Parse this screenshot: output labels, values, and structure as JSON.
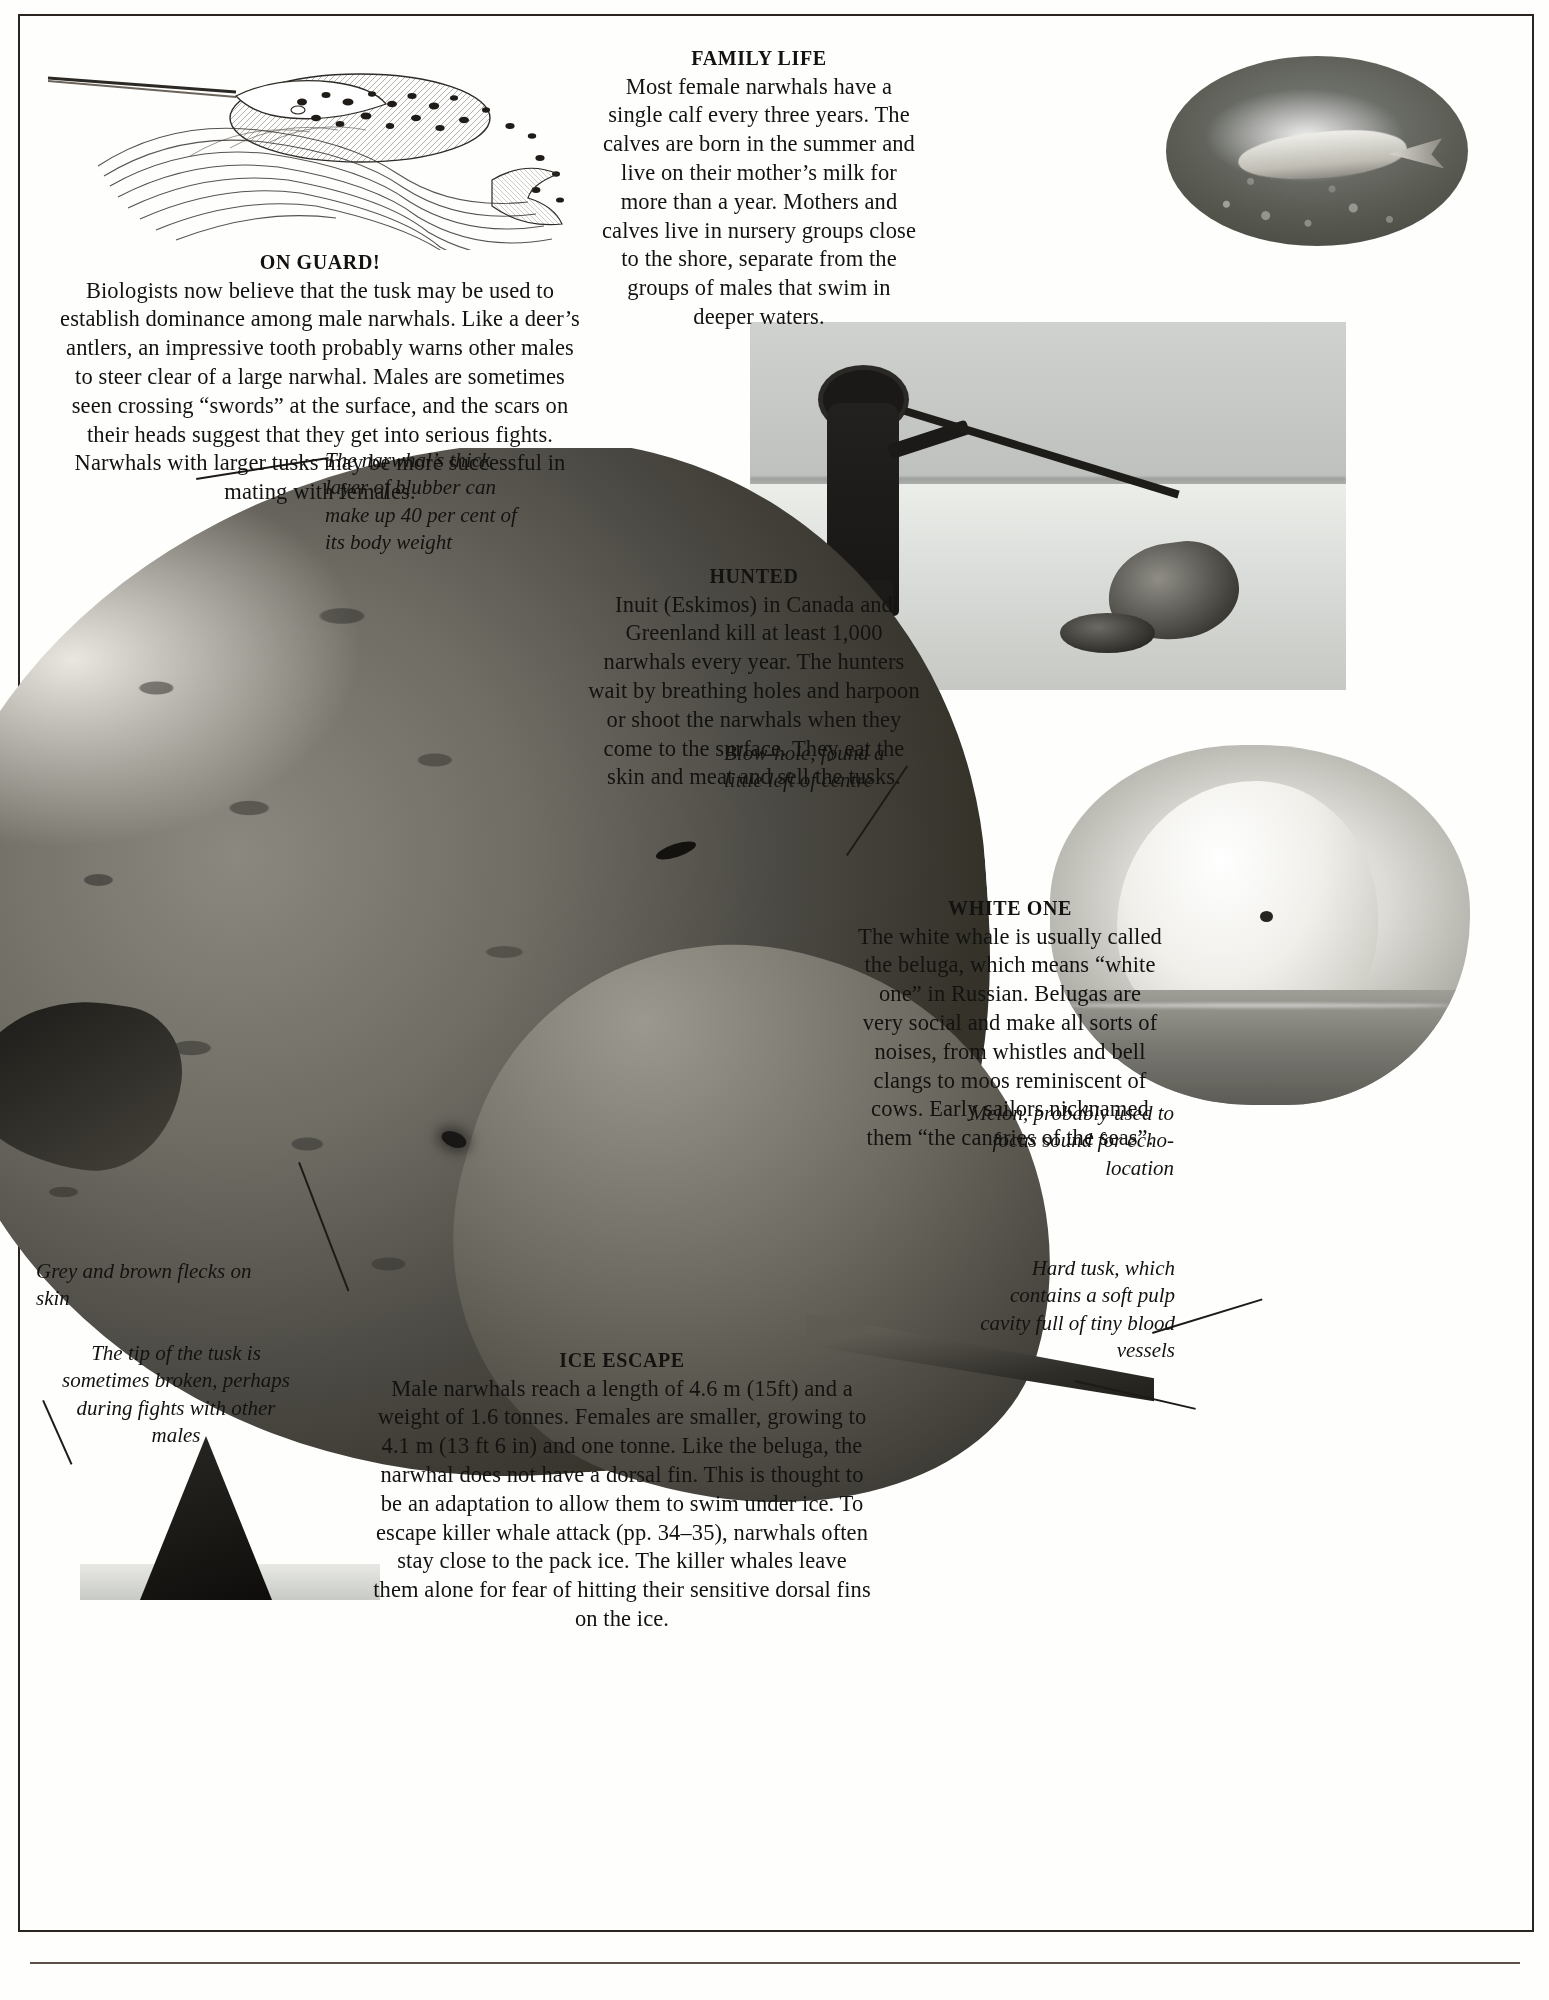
{
  "page": {
    "subject": "Narwhal",
    "sections": [
      {
        "id": "family_life",
        "heading": "FAMILY LIFE",
        "body": "Most female narwhals have a single calf every three years. The calves are born in the summer and live on their mother’s milk for more than a year. Mothers and calves live in nursery groups close to the shore, separate from the groups of males that swim in deeper waters."
      },
      {
        "id": "on_guard",
        "heading": "ON GUARD!",
        "body": "Biologists now believe that the tusk may be used to establish dominance among male narwhals. Like a deer’s antlers, an impressive tooth probably warns other males to steer clear of a large narwhal. Males are sometimes seen crossing “swords” at the surface, and the scars on their heads suggest that they get into serious fights. Narwhals with larger tusks may be more successful in mating with females."
      },
      {
        "id": "hunted",
        "heading": "HUNTED",
        "body": "Inuit (Eskimos) in Canada and Greenland kill at least 1,000 narwhals every year. The hunters wait by breathing holes and harpoon or shoot the narwhals when they come to the surface. They eat the skin and meat and sell the tusks."
      },
      {
        "id": "white_one",
        "heading": "WHITE ONE",
        "body": "The white whale is usually called the beluga, which means “white one” in Russian. Belugas are very social and make all sorts of noises, from whistles and bell clangs to moos reminiscent of cows. Early sailors nicknamed them “the canaries of the seas”."
      },
      {
        "id": "ice_escape",
        "heading": "ICE ESCAPE",
        "body": "Male narwhals reach a length of 4.6 m (15ft) and a weight of 1.6 tonnes. Females are smaller, growing to 4.1 m (13 ft 6 in) and one tonne. Like the beluga, the narwhal does not have a dorsal fin. This is thought to be an adaptation to allow them to swim under ice. To escape killer whale attack (pp. 34–35), narwhals often stay close to the pack ice. The killer whales leave them alone for fear of hitting their sensitive dorsal fins on the ice."
      }
    ],
    "captions": [
      {
        "id": "blubber",
        "text": "The narwhal’s thick layer of blubber can make up 40 per cent of its body weight"
      },
      {
        "id": "blowhole",
        "text": "Blow-hole, found a little left of centre"
      },
      {
        "id": "melon",
        "text": "Melon, probably used to focus sound for echo-location"
      },
      {
        "id": "tusk",
        "text": "Hard tusk, which contains a soft pulp cavity full of tiny blood vessels"
      },
      {
        "id": "flecks",
        "text": "Grey and brown flecks on skin"
      },
      {
        "id": "tip",
        "text": "The tip of the tusk is sometimes broken, perhaps during fights with other males"
      }
    ],
    "figures": [
      {
        "id": "engraving",
        "alt": "engraving-of-narwhal-at-surface"
      },
      {
        "id": "calf",
        "alt": "oval-photo-of-narwhal-mother-and-calf"
      },
      {
        "id": "hunter",
        "alt": "photo-of-inuit-hunter-with-harpoon-beside-narwhals-on-ice"
      },
      {
        "id": "beluga",
        "alt": "photo-of-beluga-head-surfacing"
      },
      {
        "id": "narwhal",
        "alt": "large-photo-of-narwhal-head-and-tusk"
      },
      {
        "id": "ice",
        "alt": "photo-of-tusk-tip-and-ice"
      }
    ],
    "colors": {
      "ink": "#16120f",
      "paper": "#fefefd",
      "rule": "#2a2520"
    }
  }
}
